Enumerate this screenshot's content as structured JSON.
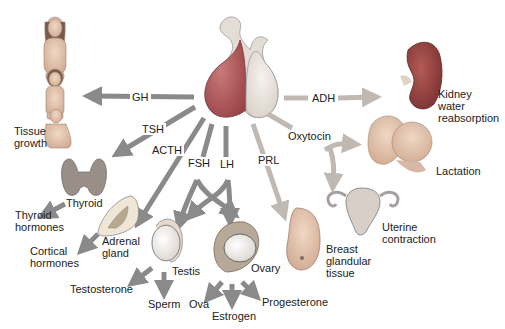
{
  "diagram": {
    "colors": {
      "anterior_lobe": "#b0565a",
      "posterior_lobe": "#e8e2dc",
      "arrow_anterior": "#8a8a8a",
      "arrow_posterior": "#c0b8b2",
      "kidney": "#8c3e3e",
      "skin": "#d9b9a4",
      "thyroid": "#9a8f88",
      "gland_outline": "#6a6a6a"
    },
    "source": {
      "name": "pituitary-gland",
      "lobes": [
        "anterior",
        "posterior"
      ]
    },
    "hormones": {
      "gh": "GH",
      "tsh": "TSH",
      "acth": "ACTH",
      "fsh": "FSH",
      "lh": "LH",
      "prl": "PRL",
      "adh": "ADH",
      "oxytocin": "Oxytocin"
    },
    "targets": {
      "tissue_growth": [
        "Tissue",
        "growth"
      ],
      "thyroid": "Thyroid",
      "thyroid_hormones": [
        "Thyroid",
        "hormones"
      ],
      "adrenal_gland": [
        "Adrenal",
        "gland"
      ],
      "cortical_hormones": [
        "Cortical",
        "hormones"
      ],
      "testis": "Testis",
      "ovary": "Ovary",
      "breast": [
        "Breast",
        "glandular",
        "tissue"
      ],
      "kidney": [
        "Kidney",
        "water",
        "reabsorption"
      ],
      "lactation": "Lactation",
      "uterine": [
        "Uterine",
        "contraction"
      ]
    },
    "products": {
      "testosterone": "Testosterone",
      "sperm": "Sperm",
      "ova": "Ova",
      "estrogen": "Estrogen",
      "progesterone": "Progesterone"
    }
  }
}
